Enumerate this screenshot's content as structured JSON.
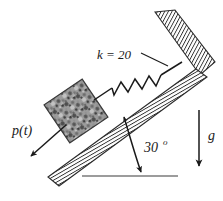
{
  "figure": {
    "background_color": "#ffffff",
    "ink_color": "#1a1a1a",
    "labels": {
      "spring_stiffness": "k = 20",
      "applied_force": "p(t)",
      "incline_angle_value": "30",
      "incline_angle_unit": "o",
      "gravity": "g"
    },
    "elements": {
      "incline": {
        "name": "hatched inclined surface",
        "angle_degrees": 30,
        "hatch_color": "#2b2b2b",
        "fill_color": "#ffffff"
      },
      "wall": {
        "name": "hatched vertical support wall",
        "hatch_color": "#2b2b2b",
        "fill_color": "#ffffff"
      },
      "block": {
        "name": "textured square mass block",
        "texture": "mottled granite gray",
        "base_color": "#8a8a8a"
      },
      "spring": {
        "name": "zigzag coil spring",
        "coil_count": 6
      },
      "force_arrow": {
        "name": "applied force arrow pointing down-slope"
      },
      "angle_arc": {
        "name": "curved angle arrow between incline and horizontal baseline"
      },
      "gravity_arrow": {
        "name": "downward gravity arrow"
      },
      "baseline": {
        "name": "horizontal reference line"
      }
    }
  }
}
